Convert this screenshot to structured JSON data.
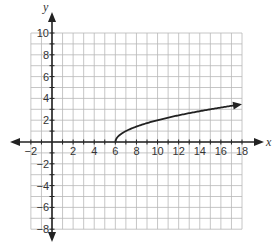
{
  "chart_data": {
    "type": "line",
    "title": "",
    "xlabel": "x",
    "ylabel": "y",
    "xlim": [
      -2,
      18
    ],
    "ylim": [
      -8,
      10
    ],
    "grid": true,
    "grid_step": 1,
    "x_ticks": [
      -2,
      2,
      4,
      6,
      8,
      10,
      12,
      14,
      16,
      18
    ],
    "y_ticks": [
      10,
      8,
      6,
      4,
      2,
      -2,
      -4,
      -6,
      -8
    ],
    "series": [
      {
        "name": "square-root curve",
        "description": "curve starting at (6, 0) rising with decreasing slope, arrow at right end",
        "x": [
          6,
          6.25,
          7,
          8,
          10,
          12,
          14,
          16,
          18
        ],
        "y": [
          0,
          0.5,
          1.0,
          1.41,
          2.0,
          2.45,
          2.83,
          3.16,
          3.46
        ],
        "start_point": [
          6,
          0
        ],
        "end_arrow": true
      }
    ],
    "colors": {
      "grid": "#b8b8b8",
      "axis": "#222222",
      "curve": "#222222"
    }
  }
}
